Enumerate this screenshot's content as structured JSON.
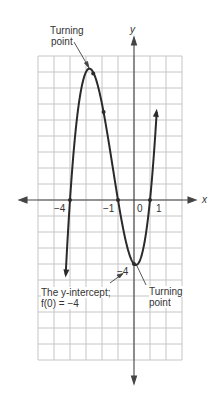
{
  "chart_data": {
    "type": "line",
    "function": "f(x) = (x+4)(x+1)(x-1)",
    "title": "",
    "xlabel": "x",
    "ylabel": "y",
    "x_tick_labels": [
      "-4",
      "-1",
      "0",
      "1"
    ],
    "x_intercepts": [
      -4,
      -1,
      1
    ],
    "y_intercept": -4,
    "xlim": [
      -6,
      3
    ],
    "ylim": [
      -10,
      9
    ],
    "grid": true,
    "series": [
      {
        "name": "f(x)",
        "x": [
          -4.3,
          -4,
          -3.5,
          -3,
          -2.5,
          -2.2,
          -2,
          -1.5,
          -1,
          -0.5,
          -0.1,
          0,
          0.5,
          1,
          1.3,
          1.45
        ],
        "values": [
          -10.3,
          0,
          5.25,
          8,
          7.875,
          6.7,
          6,
          3.125,
          0,
          -2.625,
          -3.9,
          -4,
          -3.375,
          0,
          3.8,
          6.8
        ]
      }
    ],
    "annotations": [
      {
        "text": "Turning point",
        "x": -2.7,
        "y": 8.1
      },
      {
        "text": "Turning point",
        "x": 0.0,
        "y": -4.1
      },
      {
        "text": "-4",
        "x": 0,
        "y": -4
      },
      {
        "text": "The y-intercept; f(0) = -4",
        "x": 0,
        "y": -4
      }
    ]
  },
  "labels": {
    "turning_point_top_1": "Turning",
    "turning_point_top_2": "point",
    "turning_point_bottom_1": "Turning",
    "turning_point_bottom_2": "point",
    "y_axis": "y",
    "x_axis": "x",
    "tick_neg4": "−4",
    "tick_neg1": "−1",
    "tick_0": "0",
    "tick_1": "1",
    "intercept_value": "−4",
    "intercept_line1": "The y-intercept;",
    "intercept_line2": "f(0) = −4"
  },
  "colors": {
    "curve": "#2a2a2a",
    "grid": "#c8c8c8",
    "axis": "#444444"
  }
}
